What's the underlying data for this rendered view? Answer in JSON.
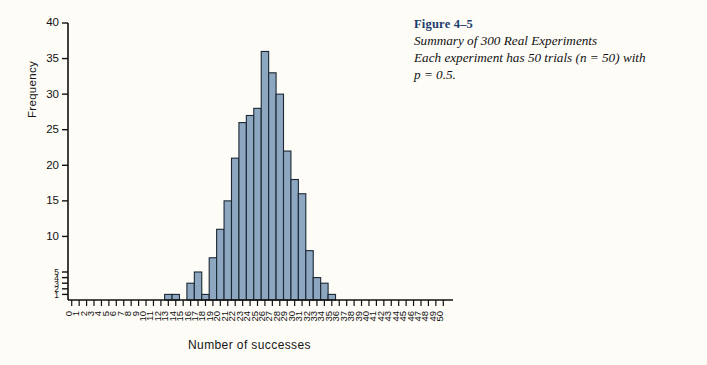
{
  "caption": {
    "figure_number": "Figure 4–5",
    "line1": "Summary of 300 Real Experiments",
    "line2": "Each experiment has 50 trials (n = 50) with",
    "line3": "p = 0.5."
  },
  "colors": {
    "bar_fill": "#8ea7c1",
    "bar_stroke": "#1b2733",
    "axis": "#111111",
    "caption_heading": "#1b3d6b",
    "page_background": "#fdfcf7"
  },
  "chart_data": {
    "type": "bar",
    "title": "",
    "subtitle": "",
    "xlabel": "Number of successes",
    "ylabel": "Frequency",
    "grid": false,
    "legend": null,
    "xlim": [
      0,
      50
    ],
    "ylim": [
      0,
      40
    ],
    "ytick_labels": [
      "1",
      "2",
      "3",
      "4",
      "5",
      "10",
      "15",
      "20",
      "25",
      "30",
      "35",
      "40"
    ],
    "ytick_values": [
      1,
      2,
      3,
      4,
      5,
      10,
      15,
      20,
      25,
      30,
      35,
      40
    ],
    "y_axis_note": "lower region 0-5 is compressed relative to 5-40",
    "xtick_labels": [
      "0",
      "1",
      "2",
      "3",
      "4",
      "5",
      "6",
      "7",
      "8",
      "9",
      "10",
      "11",
      "12",
      "13",
      "14",
      "15",
      "16",
      "17",
      "18",
      "19",
      "20",
      "21",
      "22",
      "23",
      "24",
      "25",
      "26",
      "27",
      "28",
      "29",
      "30",
      "31",
      "32",
      "33",
      "34",
      "35",
      "36",
      "37",
      "38",
      "39",
      "40",
      "41",
      "42",
      "43",
      "44",
      "45",
      "46",
      "47",
      "48",
      "49",
      "50"
    ],
    "categories": [
      0,
      1,
      2,
      3,
      4,
      5,
      6,
      7,
      8,
      9,
      10,
      11,
      12,
      13,
      14,
      15,
      16,
      17,
      18,
      19,
      20,
      21,
      22,
      23,
      24,
      25,
      26,
      27,
      28,
      29,
      30,
      31,
      32,
      33,
      34,
      35,
      36,
      37,
      38,
      39,
      40,
      41,
      42,
      43,
      44,
      45,
      46,
      47,
      48,
      49,
      50
    ],
    "values": [
      0,
      0,
      0,
      0,
      0,
      0,
      0,
      0,
      0,
      0,
      0,
      0,
      0,
      1,
      1,
      0,
      3,
      5,
      1,
      7,
      11,
      15,
      21,
      26,
      27,
      28,
      36,
      33,
      30,
      22,
      18,
      16,
      8,
      4,
      3,
      1,
      0,
      0,
      0,
      0,
      0,
      0,
      0,
      0,
      0,
      0,
      0,
      0,
      0,
      0,
      0
    ],
    "total_experiments": 300
  }
}
